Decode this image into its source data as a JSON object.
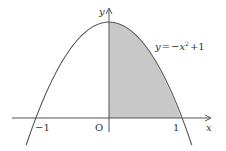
{
  "diagram": {
    "type": "function-graph",
    "function_label": {
      "y": "y",
      "eq": "=",
      "minus": "−",
      "x": "x",
      "exp": "2",
      "plus": "+1"
    },
    "function_text": "y = −x² + 1",
    "axes": {
      "x_label": "x",
      "y_label": "y",
      "origin_label": "O",
      "tick_labels": [
        "−1",
        "1"
      ]
    },
    "shaded_region": {
      "description": "Area under y = −x² + 1 from x = 0 to x = 1",
      "x_from": 0,
      "x_to": 1,
      "color": "#c8c8c8"
    },
    "colors": {
      "curve": "#555555",
      "axis": "#555555",
      "shade": "#c8c8c8",
      "text": "#333333"
    }
  }
}
